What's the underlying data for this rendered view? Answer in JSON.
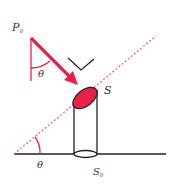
{
  "diagram": {
    "labels": {
      "p0": "P",
      "p0_sub": "0",
      "s": "S",
      "s0": "S",
      "s0_sub": "0",
      "theta_top": "θ",
      "theta_bottom": "θ"
    },
    "colors": {
      "accent": "#e8204a",
      "dashed_line": "#d9607a",
      "stroke": "#222222",
      "ellipse_fill": "#e8204a"
    }
  }
}
